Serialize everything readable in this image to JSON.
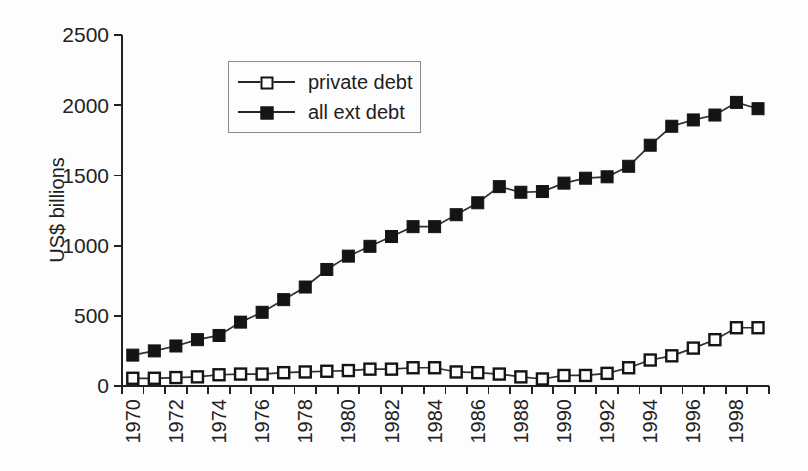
{
  "figure": {
    "background": "#fdfdfd",
    "ink": "#222222",
    "series_line_color": "#303030"
  },
  "legend": {
    "items": [
      {
        "label": "private debt",
        "marker": "open-square"
      },
      {
        "label": "all ext debt",
        "marker": "filled-square"
      }
    ]
  },
  "chart_data": {
    "type": "line",
    "title": "",
    "xlabel": "",
    "ylabel": "US$ billions",
    "ylim": [
      0,
      2500
    ],
    "y_ticks": [
      0,
      500,
      1000,
      1500,
      2000,
      2500
    ],
    "grid": false,
    "legend_position": "inside-upper-left",
    "x": [
      1970,
      1971,
      1972,
      1973,
      1974,
      1975,
      1976,
      1977,
      1978,
      1979,
      1980,
      1981,
      1982,
      1983,
      1984,
      1985,
      1986,
      1987,
      1988,
      1989,
      1990,
      1991,
      1992,
      1993,
      1994,
      1995,
      1996,
      1997,
      1998,
      1999
    ],
    "x_tick_labels": [
      "1970",
      "1972",
      "1974",
      "1976",
      "1978",
      "1980",
      "1982",
      "1984",
      "1986",
      "1988",
      "1990",
      "1992",
      "1994",
      "1996",
      "1998"
    ],
    "series": [
      {
        "name": "private debt",
        "marker": "open-square",
        "values": [
          55,
          55,
          60,
          65,
          80,
          85,
          85,
          95,
          100,
          105,
          110,
          120,
          120,
          130,
          130,
          100,
          95,
          85,
          65,
          50,
          75,
          75,
          90,
          130,
          185,
          215,
          270,
          330,
          415,
          415
        ]
      },
      {
        "name": "all ext debt",
        "marker": "filled-square",
        "values": [
          220,
          250,
          285,
          330,
          360,
          455,
          525,
          615,
          705,
          830,
          925,
          995,
          1065,
          1135,
          1135,
          1220,
          1305,
          1420,
          1380,
          1385,
          1445,
          1480,
          1490,
          1565,
          1715,
          1850,
          1895,
          1930,
          2020,
          1975
        ]
      }
    ]
  }
}
